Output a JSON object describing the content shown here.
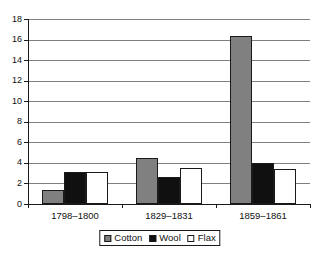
{
  "chart_data": {
    "type": "bar",
    "title": "",
    "subtitle": "",
    "xlabel": "",
    "ylabel": "",
    "categories": [
      "1798–1800",
      "1829–1831",
      "1859–1861"
    ],
    "series": [
      {
        "name": "Cotton",
        "color": "#808080",
        "values": [
          1.4,
          4.5,
          16.3
        ]
      },
      {
        "name": "Wool",
        "color": "#101010",
        "values": [
          3.1,
          2.6,
          4.0
        ]
      },
      {
        "name": "Flax",
        "color": "#ffffff",
        "values": [
          3.1,
          3.5,
          3.4
        ]
      }
    ],
    "ylim": [
      0,
      18
    ],
    "ytick_step": 2,
    "yticks": [
      18,
      16,
      14,
      12,
      10,
      8,
      6,
      4,
      2,
      0
    ],
    "ytick_labels": [
      "18",
      "16",
      "14",
      "12",
      "10",
      "8",
      "6",
      "4",
      "2",
      "0"
    ],
    "grid": true,
    "grid_axis": "y",
    "legend_position": "bottom-center",
    "legend_entries": [
      "Cotton",
      "Wool",
      "Flax"
    ],
    "bar_border_color": "#1a1a1a",
    "gridline_color": "#808080",
    "axis_color": "#1a1a1a",
    "background_color": "#ffffff"
  }
}
